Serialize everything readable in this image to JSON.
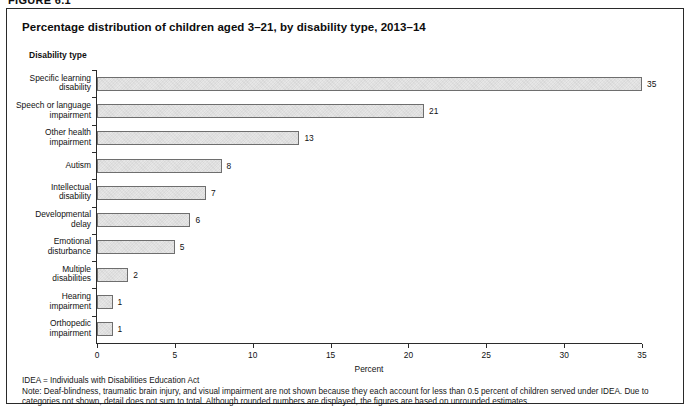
{
  "figure": {
    "label": "FIGURE 6.1",
    "title": "Percentage distribution of children aged 3–21, by disability type, 2013–14"
  },
  "notes": {
    "abbreviation": "IDEA = Individuals with Disabilities Education Act",
    "note": "Note: Deaf-blindness, traumatic brain injury, and visual impairment are not shown because they each account for less than 0.5 percent of children served under IDEA. Due to categories not shown, detail does not sum to total. Although rounded numbers are displayed, the figures are based on unrounded estimates."
  },
  "chart_data": {
    "type": "bar",
    "orientation": "horizontal",
    "title": "Percentage distribution of children aged 3–21, by disability type, 2013–14",
    "xlabel": "Percent",
    "ylabel": "Disability type",
    "xlim": [
      0,
      35
    ],
    "xticks": [
      0,
      5,
      10,
      15,
      20,
      25,
      30,
      35
    ],
    "xtick_labels": [
      "0",
      "5",
      "10",
      "15",
      "20",
      "25",
      "30",
      "35"
    ],
    "grid": false,
    "legend": false,
    "bar_color": "#e6e6e6",
    "bar_edge_color": "#6e6e6e",
    "categories": [
      "Specific learning disability",
      "Speech or language impairment",
      "Other health impairment",
      "Autism",
      "Intellectual disability",
      "Developmental delay",
      "Emotional disturbance",
      "Multiple disabilities",
      "Hearing impairment",
      "Orthopedic impairment"
    ],
    "category_lines": [
      [
        "Specific learning",
        "disability"
      ],
      [
        "Speech or language",
        "impairment"
      ],
      [
        "Other health",
        "impairment"
      ],
      [
        "Autism"
      ],
      [
        "Intellectual",
        "disability"
      ],
      [
        "Developmental",
        "delay"
      ],
      [
        "Emotional",
        "disturbance"
      ],
      [
        "Multiple",
        "disabilities"
      ],
      [
        "Hearing",
        "impairment"
      ],
      [
        "Orthopedic",
        "impairment"
      ]
    ],
    "values": [
      35,
      21,
      13,
      8,
      7,
      6,
      5,
      2,
      1,
      1
    ],
    "value_labels": [
      "35",
      "21",
      "13",
      "8",
      "7",
      "6",
      "5",
      "2",
      "1",
      "1"
    ]
  }
}
